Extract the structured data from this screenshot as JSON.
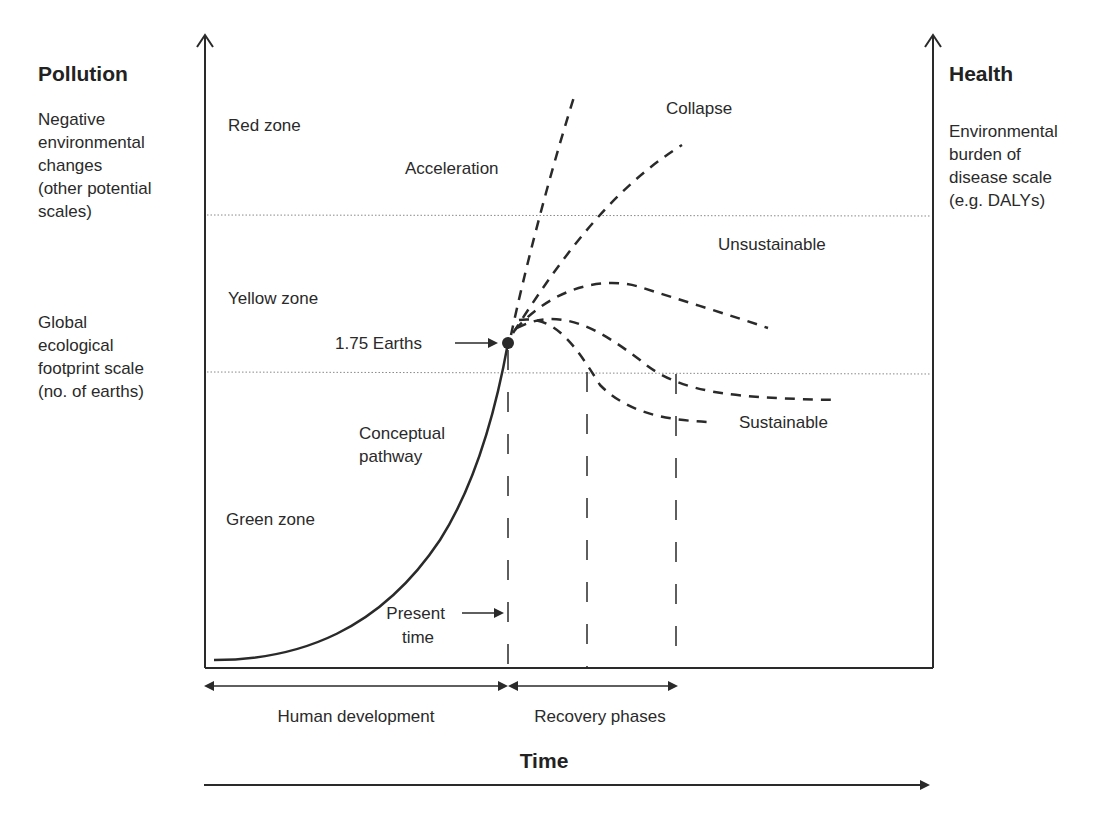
{
  "left_axis": {
    "title": "Pollution",
    "scale_upper": [
      "Negative",
      "environmental",
      "changes",
      "(other potential",
      "scales)"
    ],
    "scale_lower": [
      "Global",
      "ecological",
      "footprint scale",
      "(no. of earths)"
    ]
  },
  "right_axis": {
    "title": "Health",
    "scale": [
      "Environmental",
      "burden of",
      "disease scale",
      "(e.g. DALYs)"
    ]
  },
  "zones": {
    "red": "Red zone",
    "yellow": "Yellow zone",
    "green": "Green zone"
  },
  "annotations": {
    "acceleration": "Acceleration",
    "collapse": "Collapse",
    "unsustainable": "Unsustainable",
    "sustainable": "Sustainable",
    "earths": "1.75 Earths",
    "conceptual": [
      "Conceptual",
      "pathway"
    ],
    "present": [
      "Present",
      "time"
    ]
  },
  "bottom": {
    "human_development": "Human development",
    "recovery_phases": "Recovery phases",
    "time": "Time"
  },
  "colors": {
    "ink": "#2a2a2a",
    "background": "#ffffff",
    "threshold_line": "#888888"
  }
}
